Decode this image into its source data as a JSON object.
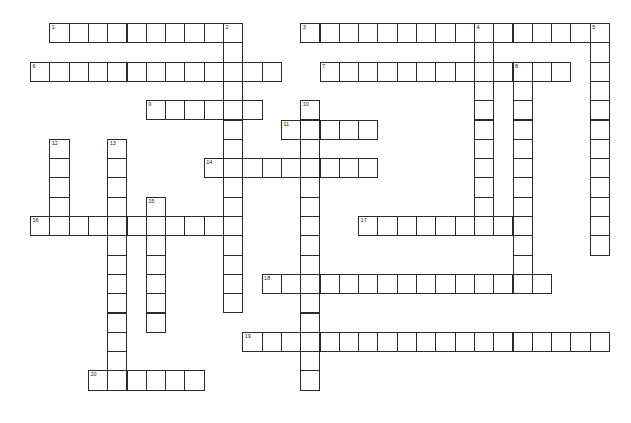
{
  "puzzle": {
    "type": "crossword",
    "cell_size": 19.3,
    "origin": {
      "x": 30,
      "y": 23
    },
    "colors": {
      "border": "#2a2a2a",
      "cell": "#ffffff",
      "background": "#ffffff"
    },
    "entries": [
      {
        "number": 1,
        "direction": "across",
        "row": 0,
        "col": 1,
        "length": 10
      },
      {
        "number": 2,
        "direction": "down",
        "row": 0,
        "col": 10,
        "length": 15
      },
      {
        "number": 3,
        "direction": "across",
        "row": 0,
        "col": 14,
        "length": 16
      },
      {
        "number": 4,
        "direction": "down",
        "row": 0,
        "col": 23,
        "length": 10
      },
      {
        "number": 5,
        "direction": "down",
        "row": 0,
        "col": 29,
        "length": 12
      },
      {
        "number": 6,
        "direction": "across",
        "row": 2,
        "col": 0,
        "length": 13
      },
      {
        "number": 7,
        "direction": "across",
        "row": 2,
        "col": 15,
        "length": 13
      },
      {
        "number": 8,
        "direction": "down",
        "row": 2,
        "col": 25,
        "length": 11
      },
      {
        "number": 9,
        "direction": "across",
        "row": 4,
        "col": 6,
        "length": 6
      },
      {
        "number": 10,
        "direction": "down",
        "row": 4,
        "col": 14,
        "length": 15
      },
      {
        "number": 11,
        "direction": "across",
        "row": 5,
        "col": 13,
        "length": 5
      },
      {
        "number": 12,
        "direction": "down",
        "row": 6,
        "col": 1,
        "length": 5
      },
      {
        "number": 13,
        "direction": "down",
        "row": 6,
        "col": 4,
        "length": 13
      },
      {
        "number": 14,
        "direction": "across",
        "row": 7,
        "col": 9,
        "length": 9
      },
      {
        "number": 15,
        "direction": "down",
        "row": 9,
        "col": 6,
        "length": 7
      },
      {
        "number": 16,
        "direction": "across",
        "row": 10,
        "col": 0,
        "length": 11
      },
      {
        "number": 17,
        "direction": "across",
        "row": 10,
        "col": 17,
        "length": 9
      },
      {
        "number": 18,
        "direction": "across",
        "row": 13,
        "col": 12,
        "length": 15
      },
      {
        "number": 19,
        "direction": "across",
        "row": 16,
        "col": 11,
        "length": 19
      },
      {
        "number": 20,
        "direction": "across",
        "row": 18,
        "col": 3,
        "length": 6
      }
    ]
  }
}
